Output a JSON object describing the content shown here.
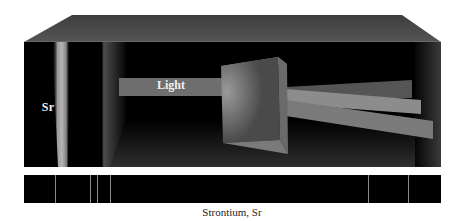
{
  "diagram": {
    "source_label": "Sr",
    "beam_label": "Light",
    "caption": "Strontium, Sr",
    "spectrum": {
      "background_color": "#000000",
      "line_color": "#8a8a8a",
      "line_positions_px": [
        55,
        90,
        97,
        110,
        368,
        408
      ]
    },
    "colors": {
      "box_top": "#4a4a4a",
      "box_interior": "#000000",
      "beam": "#6e6e6e",
      "prism": "#5a5a5a",
      "dispersed_beams": [
        "#555555",
        "#8c8c8c",
        "#7a7a7a"
      ]
    }
  }
}
